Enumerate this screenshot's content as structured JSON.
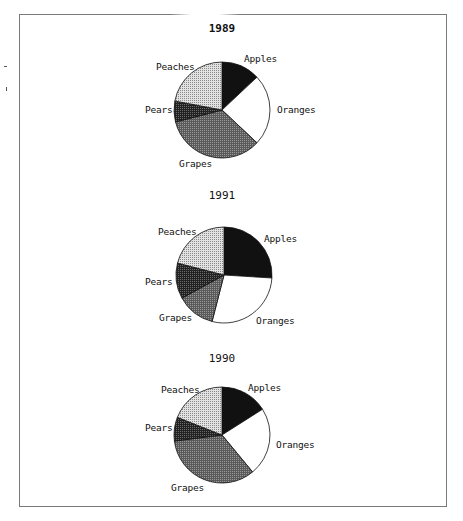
{
  "chart_data": [
    {
      "type": "pie",
      "title": "1989",
      "title_bold": true,
      "start_angle_deg": 0,
      "direction": "clockwise",
      "categories": [
        "Apples",
        "Oranges",
        "Grapes",
        "Pears",
        "Peaches"
      ],
      "values": [
        13,
        24,
        34,
        7,
        22
      ],
      "units": "percent (estimated from slice angles)"
    },
    {
      "type": "pie",
      "title": "1991",
      "title_bold": false,
      "start_angle_deg": 0,
      "direction": "clockwise",
      "categories": [
        "Apples",
        "Oranges",
        "Grapes",
        "Pears",
        "Peaches"
      ],
      "values": [
        26,
        28,
        13,
        12,
        21
      ],
      "units": "percent (estimated from slice angles)"
    },
    {
      "type": "pie",
      "title": "1990",
      "title_bold": false,
      "start_angle_deg": 0,
      "direction": "clockwise",
      "categories": [
        "Apples",
        "Oranges",
        "Grapes",
        "Pears",
        "Peaches"
      ],
      "values": [
        16,
        23,
        34,
        8,
        19
      ],
      "units": "percent (estimated from slice angles)"
    }
  ],
  "fills": {
    "Apples": "#111111",
    "Oranges": "#ffffff",
    "Grapes": "#6f6f6f",
    "Pears": "#3a3a3a",
    "Peaches": "#c9c9c9"
  },
  "layout": [
    {
      "center": [
        222,
        110
      ],
      "radius": 48,
      "title_pos": [
        182,
        22
      ],
      "labels": {
        "Apples": [
          244,
          53
        ],
        "Oranges": [
          277,
          104
        ],
        "Grapes": [
          179,
          158
        ],
        "Pears": [
          145,
          104
        ],
        "Peaches": [
          156,
          61
        ]
      }
    },
    {
      "center": [
        224,
        275
      ],
      "radius": 48,
      "title_pos": [
        182,
        189
      ],
      "labels": {
        "Apples": [
          264,
          233
        ],
        "Oranges": [
          256,
          315
        ],
        "Grapes": [
          159,
          312
        ],
        "Pears": [
          145,
          276
        ],
        "Peaches": [
          158,
          226
        ]
      }
    },
    {
      "center": [
        222,
        435
      ],
      "radius": 48,
      "title_pos": [
        182,
        352
      ],
      "labels": {
        "Apples": [
          248,
          382
        ],
        "Oranges": [
          276,
          439
        ],
        "Grapes": [
          171,
          482
        ],
        "Pears": [
          145,
          422
        ],
        "Peaches": [
          161,
          384
        ]
      }
    }
  ]
}
